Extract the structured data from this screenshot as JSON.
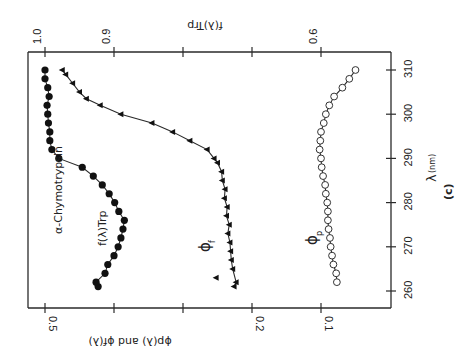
{
  "chart_data": {
    "type": "line",
    "orientation": "rotated-90-ccw",
    "title": "",
    "panel_label": "(c)",
    "protein_label": "α-Chymotrypsin",
    "xlabel": "λ(nm)",
    "ylabel_left": "ϕp(λ) and ϕf(λ)",
    "ylabel_right": "f(λ)Trp",
    "x_ticks": [
      260,
      270,
      280,
      290,
      300,
      310
    ],
    "xlim": [
      256,
      314
    ],
    "y_left_ticks": [
      {
        "value": 0.5,
        "label": "0.5"
      },
      {
        "value": 0.4,
        "label": ""
      },
      {
        "value": 0.3,
        "label": ""
      },
      {
        "value": 0.2,
        "label": "0.2"
      },
      {
        "value": 0.1,
        "label": "0.1"
      }
    ],
    "y_left_lim": [
      0.0,
      0.525
    ],
    "y_right_ticks": [
      {
        "value": 1.0,
        "label": "1.0"
      },
      {
        "value": 0.9,
        "label": "0.9"
      },
      {
        "value": 0.8,
        "label": ""
      },
      {
        "value": 0.7,
        "label": ""
      },
      {
        "value": 0.6,
        "label": "0.6"
      }
    ],
    "y_right_lim": [
      0.5,
      1.025
    ],
    "grid": false,
    "legend": "inline labels",
    "series": [
      {
        "name": "f(λ)Trp",
        "axis": "right",
        "marker": "filled-circle",
        "x": [
          261,
          262,
          264,
          266,
          268,
          270,
          272,
          274,
          276,
          278,
          280,
          282,
          284,
          286,
          288,
          290,
          292,
          294,
          296,
          298,
          300,
          302,
          304,
          306,
          308,
          310
        ],
        "values": [
          0.923,
          0.926,
          0.913,
          0.909,
          0.9,
          0.894,
          0.89,
          0.887,
          0.885,
          0.893,
          0.899,
          0.907,
          0.917,
          0.93,
          0.946,
          0.98,
          0.99,
          0.993,
          0.993,
          0.995,
          0.996,
          0.997,
          0.994,
          0.996,
          1.0,
          1.0
        ]
      },
      {
        "name": "ϕf",
        "axis": "left",
        "marker": "filled-triangle",
        "x": [
          261,
          262,
          263,
          265,
          267,
          269,
          271,
          273,
          275,
          277,
          279,
          281,
          283,
          285,
          287,
          289,
          290,
          292,
          294,
          296,
          298,
          300,
          302,
          303.5,
          305,
          307,
          309,
          310
        ],
        "values": [
          0.226,
          0.223,
          0.252,
          0.228,
          0.23,
          0.231,
          0.232,
          0.235,
          0.233,
          0.237,
          0.236,
          0.24,
          0.239,
          0.243,
          0.244,
          0.25,
          0.255,
          0.265,
          0.29,
          0.315,
          0.345,
          0.39,
          0.42,
          0.44,
          0.45,
          0.46,
          0.47,
          0.475
        ]
      },
      {
        "name": "ϕp",
        "axis": "left",
        "marker": "open-circle",
        "x": [
          262,
          264,
          266,
          268,
          270,
          272,
          274,
          276,
          278,
          280,
          282,
          284,
          286,
          288,
          290,
          292,
          294,
          296,
          298,
          300,
          302,
          304,
          306,
          308,
          310
        ],
        "values": [
          0.077,
          0.078,
          0.082,
          0.084,
          0.086,
          0.087,
          0.089,
          0.09,
          0.09,
          0.091,
          0.093,
          0.094,
          0.097,
          0.099,
          0.1,
          0.102,
          0.101,
          0.1,
          0.096,
          0.093,
          0.088,
          0.081,
          0.069,
          0.059,
          0.05
        ]
      }
    ],
    "annotations": [
      {
        "text": "α-Chymotrypsin"
      },
      {
        "text": "f(λ)Trp"
      },
      {
        "text": "ϕf"
      },
      {
        "text": "ϕp"
      }
    ]
  },
  "labels": {
    "protein": "α-Chymotrypsin",
    "f_curve": "f(λ)Trp",
    "phi_f": "ϕ",
    "phi_f_sub": "f",
    "phi_p": "ϕ",
    "phi_p_sub": "p",
    "x_axis_title": "λ",
    "x_axis_unit": "(nm)",
    "left_axis_title": "ϕp(λ) and ϕf(λ)",
    "right_axis_title": "f(λ)Trp",
    "panel": "(c)"
  }
}
